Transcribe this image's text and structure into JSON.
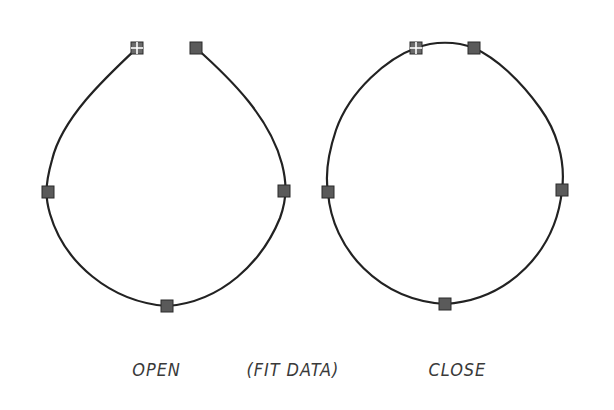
{
  "labels": {
    "open": "OPEN",
    "fit_data": "(FIT DATA)",
    "close": "CLOSE"
  },
  "colors": {
    "curve": "#222222",
    "grip_fill": "#5a5a5a",
    "grip_stroke": "#2a2a2a",
    "start_grip_fill": "#6a6a6a",
    "text": "#3a3a3a",
    "background": "#ffffff"
  },
  "shapes": [
    {
      "name": "open-spline",
      "closed": false,
      "fit_points": [
        [
          137,
          48
        ],
        [
          48,
          192
        ],
        [
          167,
          306
        ],
        [
          284,
          191
        ],
        [
          196,
          48
        ]
      ],
      "start_point": [
        137,
        48
      ]
    },
    {
      "name": "closed-spline",
      "closed": true,
      "fit_points": [
        [
          416,
          48
        ],
        [
          328,
          192
        ],
        [
          445,
          304
        ],
        [
          562,
          190
        ],
        [
          474,
          48
        ]
      ],
      "start_point": [
        416,
        48
      ]
    }
  ]
}
